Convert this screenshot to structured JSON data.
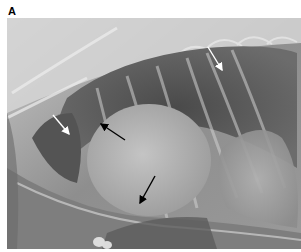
{
  "figure": {
    "panel_label": "A",
    "image": {
      "type": "radiograph",
      "description": "Lateral thoracic radiograph",
      "tones": {
        "background": "#8a8a8a",
        "lung_dark": "#3a3a3a",
        "cardiac_silhouette": "#b8b8b8",
        "bone": "#e6e6e6"
      }
    },
    "arrows": [
      {
        "id": "arrow-upper-right",
        "from": [
          201,
          29
        ],
        "to": [
          215,
          52
        ],
        "color": "#ffffff"
      },
      {
        "id": "arrow-left",
        "from": [
          46,
          97
        ],
        "to": [
          62,
          116
        ],
        "color": "#ffffff"
      },
      {
        "id": "arrow-center",
        "from": [
          118,
          122
        ],
        "to": [
          94,
          106
        ],
        "color": "#000000"
      },
      {
        "id": "arrow-bottom",
        "from": [
          148,
          158
        ],
        "to": [
          133,
          185
        ],
        "color": "#000000"
      }
    ]
  }
}
